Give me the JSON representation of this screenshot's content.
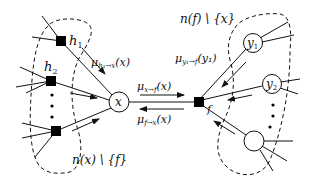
{
  "diagram": {
    "type": "factor-graph",
    "nodes": {
      "x": {
        "label": "x",
        "kind": "variable"
      },
      "f": {
        "label": "f",
        "kind": "factor"
      },
      "h1": {
        "label": "h",
        "sub": "1",
        "kind": "factor"
      },
      "h2": {
        "label": "h",
        "sub": "2",
        "kind": "factor"
      },
      "y1": {
        "label": "y",
        "sub": "1",
        "kind": "variable"
      },
      "y2": {
        "label": "y",
        "sub": "2",
        "kind": "variable"
      },
      "hn": {
        "label": "",
        "kind": "factor"
      },
      "yn": {
        "label": "",
        "kind": "variable"
      }
    },
    "messages": {
      "h1_to_x": {
        "mu": "μ",
        "sub": "h₁→x",
        "arg": "(x)"
      },
      "x_to_f": {
        "mu": "μ",
        "sub": "x→f",
        "arg": "(x)"
      },
      "f_to_x": {
        "mu": "μ",
        "sub": "f→x",
        "arg": "(x)"
      },
      "y1_to_f": {
        "mu": "μ",
        "sub": "y₁→f",
        "arg": "(y₁)"
      }
    },
    "sets": {
      "left": "n(x) \\ {f}",
      "right": "n(f) \\ {x}"
    },
    "ellipsis": "⋮",
    "colors": {
      "stroke": "#111111",
      "fill_factor": "#000000",
      "fill_variable": "#ffffff"
    }
  }
}
